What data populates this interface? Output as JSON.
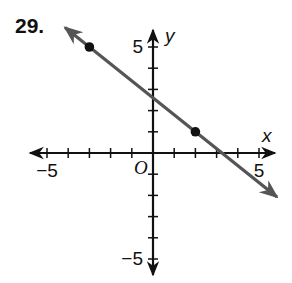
{
  "problem": {
    "number": "29."
  },
  "chart_data": {
    "type": "line",
    "title": "",
    "xlabel": "x",
    "ylabel": "y",
    "origin_label": "O",
    "xlim": [
      -6,
      6
    ],
    "ylim": [
      -6,
      6
    ],
    "grid": false,
    "x_tick_labels": [
      {
        "value": -5,
        "label": "−5"
      },
      {
        "value": 5,
        "label": "5"
      }
    ],
    "y_tick_labels": [
      {
        "value": 5,
        "label": "5"
      },
      {
        "value": -5,
        "label": "−5"
      }
    ],
    "tick_step": 1,
    "series": [
      {
        "name": "line",
        "color": "#555555",
        "points": [
          {
            "x": -3,
            "y": 5
          },
          {
            "x": 2,
            "y": 1
          }
        ],
        "slope": -0.8,
        "y_intercept": 2.6,
        "arrows_both_ends": true
      }
    ]
  }
}
